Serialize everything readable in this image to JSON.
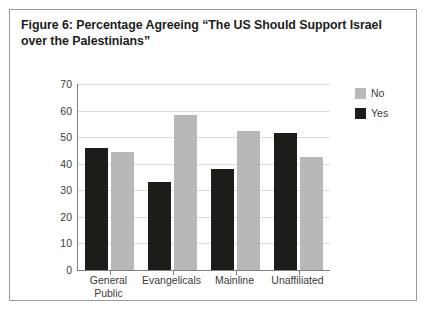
{
  "figure": {
    "caption": "Figure 6: Percentage Agreeing “The US Should Support Israel over the Palestinians”"
  },
  "legend": {
    "position": "top-right",
    "items": [
      {
        "label": "No",
        "color": "#b8b8b8"
      },
      {
        "label": "Yes",
        "color": "#1c1c18"
      }
    ]
  },
  "axis": {
    "y_ticks": [
      "70",
      "60",
      "50",
      "40",
      "30",
      "20",
      "10",
      "0"
    ]
  },
  "xlabels": [
    "General\nPublic",
    "Evangelicals",
    "Mainline",
    "Unaffiliated"
  ],
  "chart_data": {
    "type": "bar",
    "title": "Figure 6: Percentage Agreeing “The US Should Support Israel over the Palestinians”",
    "xlabel": "",
    "ylabel": "",
    "ylim": [
      0,
      70
    ],
    "ytick_step": 10,
    "grid": true,
    "legend_position": "top-right",
    "categories": [
      "General Public",
      "Evangelicals",
      "Mainline",
      "Unaffiliated"
    ],
    "series": [
      {
        "name": "Yes",
        "color": "#1c1c18",
        "values": [
          46,
          33,
          38,
          51.5
        ]
      },
      {
        "name": "No",
        "color": "#b8b8b8",
        "values": [
          44.5,
          58.5,
          52.5,
          42.5
        ]
      }
    ],
    "bar_order_in_group": [
      "Yes",
      "No"
    ]
  }
}
